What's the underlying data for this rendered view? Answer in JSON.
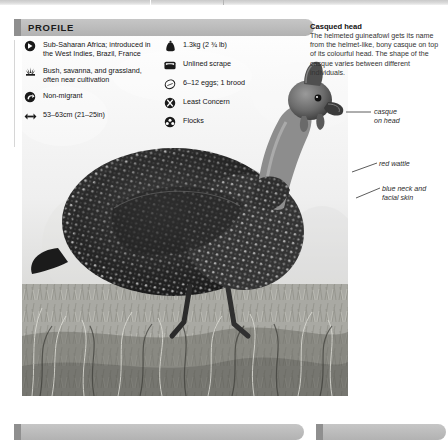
{
  "page": {
    "background_color": "#ffffff",
    "top_strip_color": "#cfcfcf"
  },
  "profile": {
    "header_label": "PROFILE",
    "header_color": "#bdbdbd",
    "accent_color": "#8f8f8f",
    "left_column": [
      {
        "icon": "distribution-globe-icon",
        "text": "Sub-Saharan Africa; introduced in the West Indies, Brazil, France"
      },
      {
        "icon": "habitat-grass-icon",
        "text": "Bush, savanna, and grassland, often near cultivation"
      },
      {
        "icon": "migration-arrow-icon",
        "text": "Non-migrant"
      },
      {
        "icon": "size-arrows-icon",
        "text": "53–63cm (21–25in)"
      }
    ],
    "right_column": [
      {
        "icon": "weight-icon",
        "text": "1.3kg (2 ¾ lb)"
      },
      {
        "icon": "nest-icon",
        "text": "Unlined scrape"
      },
      {
        "icon": "egg-icon",
        "text": "6–12 eggs; 1 brood"
      },
      {
        "icon": "conservation-status-icon",
        "text": "Least Concern"
      },
      {
        "icon": "social-flock-icon",
        "text": "Flocks"
      }
    ]
  },
  "caption": {
    "title": "Casqued head",
    "body": "The helmeted guineafowl gets its name from the helmet-like, bony casque on top of its colourful head. The shape of the casque varies between different individuals."
  },
  "annotations": [
    {
      "name": "casque-annotation",
      "line1": "casque",
      "line2": "on head"
    },
    {
      "name": "wattle-annotation",
      "line1": "red wattle",
      "line2": ""
    },
    {
      "name": "blue-skin-annotation",
      "line1": "blue neck and",
      "line2": "facial skin"
    }
  ],
  "photo": {
    "subject": "helmeted-guineafowl-photograph"
  }
}
